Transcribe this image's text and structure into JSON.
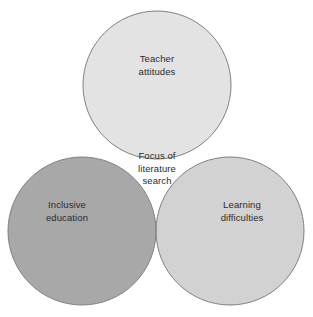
{
  "diagram": {
    "type": "venn-3-circle",
    "background_color": "#ffffff",
    "stroke_color": "#808080",
    "stroke_width": 1,
    "text_color": "#2b2b2b",
    "canvas": {
      "width": 313,
      "height": 317
    },
    "sets": [
      {
        "id": "teacher-attitudes",
        "label": "Teacher\nattitudes",
        "position": "top",
        "fill_color": "#e3e3e3",
        "center": {
          "x": 157,
          "y": 85
        },
        "radius": 74
      },
      {
        "id": "inclusive-education",
        "label": "Inclusive\neducation",
        "position": "bottom-left",
        "fill_color": "#a8a8a8",
        "center": {
          "x": 82,
          "y": 231
        },
        "radius": 74
      },
      {
        "id": "learning-difficulties",
        "label": "Learning\ndifficulties",
        "position": "bottom-right",
        "fill_color": "#d2d2d2",
        "center": {
          "x": 230,
          "y": 231
        },
        "radius": 74
      }
    ],
    "intersections": [
      {
        "id": "triple-overlap",
        "label": "Focus of\nliterature\nsearch",
        "sets": [
          "teacher-attitudes",
          "inclusive-education",
          "learning-difficulties"
        ],
        "fill_color": "#f0f0f0"
      },
      {
        "id": "top-left-overlap",
        "label": "",
        "sets": [
          "teacher-attitudes",
          "inclusive-education"
        ],
        "fill_color": "#b0b0b0"
      },
      {
        "id": "top-right-overlap",
        "label": "",
        "sets": [
          "teacher-attitudes",
          "learning-difficulties"
        ],
        "fill_color": "#dcdcdc"
      },
      {
        "id": "bottom-overlap",
        "label": "",
        "sets": [
          "inclusive-education",
          "learning-difficulties"
        ],
        "fill_color": "#c4c4c4"
      }
    ]
  }
}
